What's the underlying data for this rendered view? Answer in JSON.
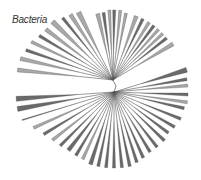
{
  "title": "Bacteria",
  "colors": {
    "wedge_dark": "#6a6a6a",
    "wedge_light": "#a8a8a8",
    "branch": "#555555"
  },
  "tree": {
    "upper_hub": [
      113,
      80
    ],
    "lower_hub": [
      114,
      92
    ],
    "root": [
      116,
      86
    ],
    "upper_wedges": [
      {
        "angle": 186,
        "len": 96,
        "w": 4,
        "tone": "light"
      },
      {
        "angle": 193,
        "len": 95,
        "w": 4,
        "tone": "light"
      },
      {
        "angle": 199,
        "len": 92,
        "w": 3,
        "tone": "dark"
      },
      {
        "angle": 205,
        "len": 90,
        "w": 3,
        "tone": "light"
      },
      {
        "angle": 211,
        "len": 86,
        "w": 3,
        "tone": "dark"
      },
      {
        "angle": 217,
        "len": 84,
        "w": 4,
        "tone": "light"
      },
      {
        "angle": 224,
        "len": 84,
        "w": 5,
        "tone": "light"
      },
      {
        "angle": 231,
        "len": 80,
        "w": 3,
        "tone": "dark"
      },
      {
        "angle": 237,
        "len": 78,
        "w": 4,
        "tone": "light"
      },
      {
        "angle": 243,
        "len": 76,
        "w": 5,
        "tone": "light"
      },
      {
        "angle": 257,
        "len": 68,
        "w": 4,
        "tone": "light"
      },
      {
        "angle": 262,
        "len": 68,
        "w": 3,
        "tone": "dark"
      },
      {
        "angle": 267,
        "len": 70,
        "w": 3,
        "tone": "light"
      },
      {
        "angle": 271,
        "len": 70,
        "w": 3,
        "tone": "dark"
      },
      {
        "angle": 276,
        "len": 70,
        "w": 3,
        "tone": "light"
      },
      {
        "angle": 281,
        "len": 68,
        "w": 3,
        "tone": "light"
      },
      {
        "angle": 290,
        "len": 68,
        "w": 4,
        "tone": "light"
      },
      {
        "angle": 296,
        "len": 68,
        "w": 3,
        "tone": "dark"
      },
      {
        "angle": 302,
        "len": 68,
        "w": 3,
        "tone": "light"
      },
      {
        "angle": 307,
        "len": 68,
        "w": 3,
        "tone": "dark"
      },
      {
        "angle": 312,
        "len": 68,
        "w": 3,
        "tone": "light"
      },
      {
        "angle": 317,
        "len": 68,
        "w": 3,
        "tone": "light"
      },
      {
        "angle": 322,
        "len": 68,
        "w": 3,
        "tone": "dark"
      },
      {
        "angle": 329,
        "len": 70,
        "w": 4,
        "tone": "light"
      }
    ],
    "lower_wedges": [
      {
        "angle": 343,
        "len": 76,
        "w": 5,
        "tone": "dark"
      },
      {
        "angle": 350,
        "len": 74,
        "w": 3,
        "tone": "dark"
      },
      {
        "angle": 355,
        "len": 74,
        "w": 3,
        "tone": "light"
      },
      {
        "angle": 2,
        "len": 74,
        "w": 3,
        "tone": "dark"
      },
      {
        "angle": 8,
        "len": 74,
        "w": 3,
        "tone": "light"
      },
      {
        "angle": 13,
        "len": 72,
        "w": 3,
        "tone": "dark"
      },
      {
        "angle": 22,
        "len": 72,
        "w": 3,
        "tone": "dark"
      },
      {
        "angle": 30,
        "len": 70,
        "w": 3,
        "tone": "dark"
      },
      {
        "angle": 37,
        "len": 68,
        "w": 3,
        "tone": "dark"
      },
      {
        "angle": 44,
        "len": 70,
        "w": 3,
        "tone": "dark"
      },
      {
        "angle": 52,
        "len": 70,
        "w": 3,
        "tone": "dark"
      },
      {
        "angle": 59,
        "len": 70,
        "w": 3,
        "tone": "dark"
      },
      {
        "angle": 66,
        "len": 72,
        "w": 3,
        "tone": "dark"
      },
      {
        "angle": 72,
        "len": 74,
        "w": 3,
        "tone": "dark"
      },
      {
        "angle": 78,
        "len": 76,
        "w": 3,
        "tone": "dark"
      },
      {
        "angle": 84,
        "len": 76,
        "w": 3,
        "tone": "dark"
      },
      {
        "angle": 90,
        "len": 76,
        "w": 3,
        "tone": "dark"
      },
      {
        "angle": 96,
        "len": 76,
        "w": 3,
        "tone": "dark"
      },
      {
        "angle": 102,
        "len": 76,
        "w": 3,
        "tone": "dark"
      },
      {
        "angle": 108,
        "len": 76,
        "w": 4,
        "tone": "dark"
      },
      {
        "angle": 115,
        "len": 74,
        "w": 3,
        "tone": "light"
      },
      {
        "angle": 121,
        "len": 74,
        "w": 3,
        "tone": "dark"
      },
      {
        "angle": 128,
        "len": 74,
        "w": 4,
        "tone": "dark"
      },
      {
        "angle": 135,
        "len": 76,
        "w": 3,
        "tone": "dark"
      },
      {
        "angle": 142,
        "len": 78,
        "w": 3,
        "tone": "light"
      },
      {
        "angle": 149,
        "len": 82,
        "w": 3,
        "tone": "dark"
      },
      {
        "angle": 156,
        "len": 88,
        "w": 3,
        "tone": "light"
      },
      {
        "angle": 163,
        "len": 96,
        "w": 1,
        "tone": "dark"
      },
      {
        "angle": 170,
        "len": 98,
        "w": 5,
        "tone": "dark"
      },
      {
        "angle": 176,
        "len": 98,
        "w": 5,
        "tone": "dark"
      }
    ]
  }
}
